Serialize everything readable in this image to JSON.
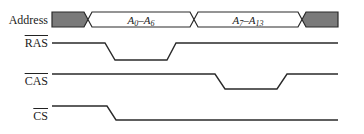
{
  "diagram": {
    "type": "timing-diagram",
    "colors": {
      "line": "#2a2a2a",
      "invalid_fill": "#7a7a7a",
      "background": "#ffffff"
    },
    "signals": [
      {
        "name": "Address",
        "active_low": false,
        "kind": "bus",
        "segments": [
          {
            "state": "invalid",
            "from_x": 52,
            "to_x": 88
          },
          {
            "state": "valid",
            "label_main": "A",
            "sub1": "0",
            "dash": "–",
            "label_main2": "A",
            "sub2": "6",
            "from_x": 88,
            "to_x": 194
          },
          {
            "state": "valid",
            "label_main": "A",
            "sub1": "7",
            "dash": "–",
            "label_main2": "A",
            "sub2": "13",
            "from_x": 194,
            "to_x": 302
          },
          {
            "state": "invalid",
            "from_x": 302,
            "to_x": 338
          }
        ]
      },
      {
        "name": "RAS",
        "active_low": true,
        "kind": "line",
        "transitions": [
          {
            "level": "high",
            "until_x": 105
          },
          {
            "level": "low",
            "from_x": 115,
            "until_x": 167
          },
          {
            "level": "high",
            "from_x": 176
          }
        ]
      },
      {
        "name": "CAS",
        "active_low": true,
        "kind": "line",
        "transitions": [
          {
            "level": "high",
            "until_x": 215
          },
          {
            "level": "low",
            "from_x": 225,
            "until_x": 277
          },
          {
            "level": "high",
            "from_x": 287
          }
        ]
      },
      {
        "name": "CS",
        "active_low": true,
        "kind": "line",
        "transitions": [
          {
            "level": "high",
            "until_x": 107
          },
          {
            "level": "low",
            "from_x": 116
          }
        ]
      }
    ]
  }
}
